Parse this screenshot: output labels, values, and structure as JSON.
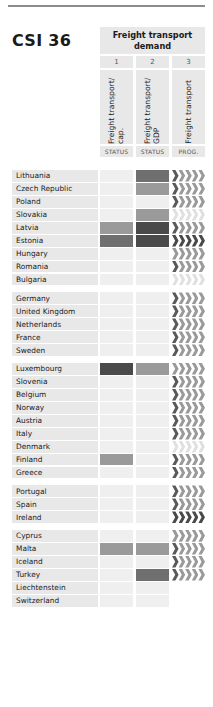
{
  "header": {
    "title": "CSI 36",
    "group_label": "Freight transport demand",
    "column_numbers": [
      "1",
      "2",
      "3"
    ],
    "column_labels": [
      "Freight transport/ cap.",
      "Freight transport/ GDP",
      "Freight transport"
    ],
    "column_types": [
      "STATUS",
      "STATUS",
      "PROG."
    ]
  },
  "legend_colors": {
    "none": "#efefef",
    "pale": "#e6e6e6",
    "mid": "#9a9a9a",
    "dark": "#6f6f6f",
    "very_dark": "#4a4a4a",
    "row_background": "#e8e8e8",
    "header_background": "#e8e8e8"
  },
  "groups": [
    {
      "rows": [
        {
          "country": "Lithuania",
          "status1": "none",
          "status2": "dark",
          "prog": "lead-dark"
        },
        {
          "country": "Czech Republic",
          "status1": "none",
          "status2": "mid",
          "prog": "lead-dark"
        },
        {
          "country": "Poland",
          "status1": "none",
          "status2": "none",
          "prog": "lead-dark"
        },
        {
          "country": "Slovakia",
          "status1": "none",
          "status2": "mid",
          "prog": "all-light"
        },
        {
          "country": "Latvia",
          "status1": "mid",
          "status2": "vdark",
          "prog": "lead-dark"
        },
        {
          "country": "Estonia",
          "status1": "dark",
          "status2": "vdark",
          "prog": "all-dark"
        },
        {
          "country": "Hungary",
          "status1": "none",
          "status2": "none",
          "prog": "all-mid"
        },
        {
          "country": "Romania",
          "status1": "none",
          "status2": "none",
          "prog": "lead-dark"
        },
        {
          "country": "Bulgaria",
          "status1": "none",
          "status2": "none",
          "prog": "all-light"
        }
      ]
    },
    {
      "rows": [
        {
          "country": "Germany",
          "status1": "none",
          "status2": "none",
          "prog": "lead-dark"
        },
        {
          "country": "United Kingdom",
          "status1": "none",
          "status2": "none",
          "prog": "lead-dark"
        },
        {
          "country": "Netherlands",
          "status1": "none",
          "status2": "none",
          "prog": "lead-dark"
        },
        {
          "country": "France",
          "status1": "none",
          "status2": "none",
          "prog": "lead-dark"
        },
        {
          "country": "Sweden",
          "status1": "none",
          "status2": "none",
          "prog": "lead-dark"
        }
      ]
    },
    {
      "rows": [
        {
          "country": "Luxembourg",
          "status1": "vdark",
          "status2": "mid",
          "prog": "all-mid"
        },
        {
          "country": "Slovenia",
          "status1": "none",
          "status2": "none",
          "prog": "lead-dark"
        },
        {
          "country": "Belgium",
          "status1": "none",
          "status2": "none",
          "prog": "lead-dark"
        },
        {
          "country": "Norway",
          "status1": "none",
          "status2": "none",
          "prog": "lead-dark"
        },
        {
          "country": "Austria",
          "status1": "none",
          "status2": "none",
          "prog": "lead-dark"
        },
        {
          "country": "Italy",
          "status1": "none",
          "status2": "none",
          "prog": "lead-dark"
        },
        {
          "country": "Denmark",
          "status1": "none",
          "status2": "none",
          "prog": "all-light"
        },
        {
          "country": "Finland",
          "status1": "mid",
          "status2": "none",
          "prog": "lead-dark"
        },
        {
          "country": "Greece",
          "status1": "none",
          "status2": "none",
          "prog": "lead-dark"
        }
      ]
    },
    {
      "rows": [
        {
          "country": "Portugal",
          "status1": "none",
          "status2": "none",
          "prog": "lead-dark"
        },
        {
          "country": "Spain",
          "status1": "none",
          "status2": "none",
          "prog": "lead-dark"
        },
        {
          "country": "Ireland",
          "status1": "none",
          "status2": "none",
          "prog": "all-dark"
        }
      ]
    },
    {
      "rows": [
        {
          "country": "Cyprus",
          "status1": "none",
          "status2": "none",
          "prog": "all-mid"
        },
        {
          "country": "Malta",
          "status1": "mid",
          "status2": "mid",
          "prog": "lead-dark"
        },
        {
          "country": "Iceland",
          "status1": "none",
          "status2": "none",
          "prog": "lead-dark"
        },
        {
          "country": "Turkey",
          "status1": "none",
          "status2": "dark",
          "prog": "lead-dark"
        },
        {
          "country": "Liechtenstein",
          "status1": "none",
          "status2": "none",
          "prog": "blank"
        },
        {
          "country": "Switzerland",
          "status1": "none",
          "status2": "none",
          "prog": "blank"
        }
      ]
    }
  ]
}
